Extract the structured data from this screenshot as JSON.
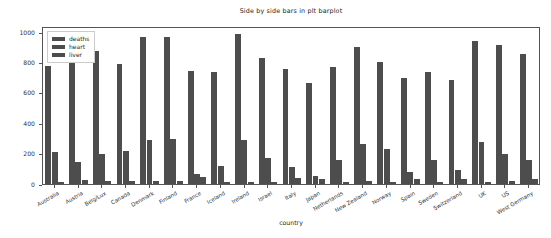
{
  "chart_data": {
    "type": "bar",
    "title": "Side by side bars in plt barplot",
    "xlabel": "country",
    "ylabel": "",
    "ylim": [
      0,
      1040
    ],
    "yticks": [
      0,
      200,
      400,
      600,
      800,
      1000
    ],
    "grid": false,
    "legend_position": "upper left",
    "categories": [
      "Australia",
      "Austria",
      "Belg/Lux",
      "Canada",
      "Denmark",
      "Finland",
      "France",
      "Iceland",
      "Ireland",
      "Israel",
      "Italy",
      "Japan",
      "Netherlands",
      "New Zealand",
      "Norway",
      "Spain",
      "Sweden",
      "Switzerland",
      "UK",
      "US",
      "West Germany"
    ],
    "series": [
      {
        "name": "deaths",
        "color": "#4d4d4d",
        "values": [
          780,
          860,
          875,
          790,
          965,
          965,
          745,
          735,
          990,
          830,
          755,
          665,
          770,
          900,
          800,
          700,
          735,
          685,
          940,
          915,
          855
        ]
      },
      {
        "name": "heart",
        "color": "#4d4d4d",
        "values": [
          210,
          145,
          200,
          220,
          290,
          295,
          65,
          120,
          290,
          170,
          110,
          55,
          160,
          265,
          230,
          80,
          155,
          95,
          275,
          200,
          160
        ]
      },
      {
        "name": "liver",
        "color": "#4d4d4d",
        "values": [
          16,
          24,
          20,
          18,
          22,
          20,
          45,
          10,
          16,
          16,
          40,
          30,
          15,
          20,
          12,
          36,
          16,
          32,
          12,
          22,
          30
        ]
      }
    ]
  },
  "legend": {
    "items": [
      {
        "label": "deaths"
      },
      {
        "label": "heart"
      },
      {
        "label": "liver"
      }
    ]
  }
}
